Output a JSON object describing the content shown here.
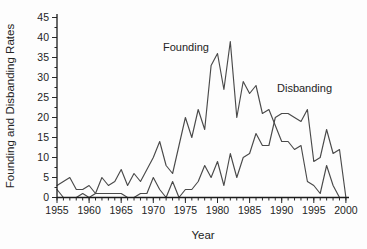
{
  "figure": {
    "ylabel": "Founding and Disbanding Rates",
    "xlabel": "Year",
    "founding_label": "Founding",
    "disbanding_label": "Disbanding"
  },
  "colors": {
    "line": "#4a4a4a",
    "axis": "#1c1c1c",
    "text": "#242424",
    "background": "#fdfdfd"
  },
  "chart_data": {
    "type": "line",
    "title": "",
    "xlabel": "Year",
    "ylabel": "Founding and Disbanding Rates",
    "xlim": [
      1955,
      2000
    ],
    "ylim": [
      0,
      45
    ],
    "grid": false,
    "legend": "inline-annotations",
    "x_major_ticks": [
      1955,
      1960,
      1965,
      1970,
      1975,
      1980,
      1985,
      1990,
      1995,
      2000
    ],
    "x_minor_tick_step": 1,
    "y_major_ticks": [
      0,
      5,
      10,
      15,
      20,
      25,
      30,
      35,
      40,
      45
    ],
    "y_minor_tick_step": 2.5,
    "x": [
      1955,
      1956,
      1957,
      1958,
      1959,
      1960,
      1961,
      1962,
      1963,
      1964,
      1965,
      1966,
      1967,
      1968,
      1969,
      1970,
      1971,
      1972,
      1973,
      1974,
      1975,
      1976,
      1977,
      1978,
      1979,
      1980,
      1981,
      1982,
      1983,
      1984,
      1985,
      1986,
      1987,
      1988,
      1989,
      1990,
      1991,
      1992,
      1993,
      1994,
      1995,
      1996,
      1997,
      1998,
      1999,
      2000
    ],
    "series": [
      {
        "name": "Founding",
        "values": [
          3,
          4,
          5,
          2,
          2,
          3,
          1,
          5,
          3,
          4,
          7,
          3,
          6,
          4,
          7,
          10,
          14,
          8,
          6,
          13,
          20,
          15,
          22,
          17,
          33,
          36,
          27,
          39,
          20,
          29,
          26,
          28,
          21,
          22,
          18,
          14,
          14,
          12,
          13,
          4,
          3,
          1,
          8,
          3,
          0,
          0
        ]
      },
      {
        "name": "Disbanding",
        "values": [
          2,
          0,
          0,
          0,
          1,
          0,
          1,
          1,
          1,
          1,
          1,
          0,
          0,
          1,
          1,
          5,
          2,
          0,
          4,
          0,
          2,
          2,
          4,
          8,
          5,
          9,
          3,
          11,
          5,
          10,
          11,
          16,
          13,
          13,
          20,
          21,
          21,
          20,
          19,
          22,
          9,
          10,
          17,
          11,
          12,
          0
        ]
      }
    ]
  }
}
